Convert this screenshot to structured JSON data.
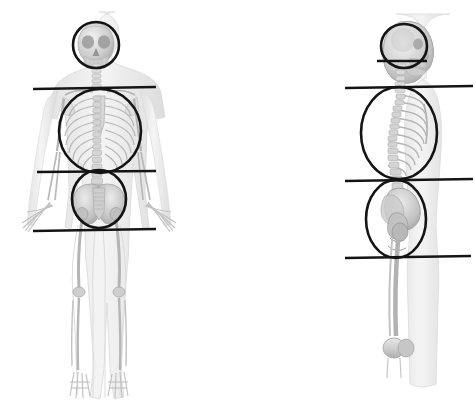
{
  "canvas": {
    "width": 475,
    "height": 414,
    "background": "#ffffff",
    "title": "Human skeleton anterior and lateral views with body-region overlays"
  },
  "style": {
    "overlay_stroke": "#141414",
    "overlay_stroke_width": 2.6,
    "skeleton_bone_light": "#e4e4e4",
    "skeleton_bone_mid": "#bdbdbd",
    "skeleton_bone_dark": "#8d8d8d",
    "skeleton_outline": "#d2d2d2",
    "body_silhouette": "#ededed"
  },
  "figures": [
    {
      "id": "anterior-figure",
      "name": "Anterior skeleton figure",
      "view": "anterior",
      "label": "Front view",
      "center_x": 99,
      "overlays": {
        "circles": [
          {
            "id": "head-circle-front",
            "name": "head-region-circle",
            "region": "head",
            "cx": 96,
            "cy": 45,
            "rx": 23,
            "ry": 23
          },
          {
            "id": "thorax-circle-front",
            "name": "thorax-region-circle",
            "region": "thorax",
            "cx": 100,
            "cy": 131,
            "rx": 41,
            "ry": 42
          },
          {
            "id": "pelvis-circle-front",
            "name": "pelvis-region-circle",
            "region": "pelvis",
            "cx": 99,
            "cy": 199,
            "rx": 27,
            "ry": 29
          }
        ],
        "lines": [
          {
            "id": "line-shoulder-front",
            "name": "shoulder-reference-line",
            "label": "Shoulder line",
            "x1": 33,
            "y1": 89,
            "x2": 156,
            "y2": 87
          },
          {
            "id": "line-waist-front",
            "name": "waist-reference-line",
            "label": "Waist line",
            "x1": 37,
            "y1": 172,
            "x2": 156,
            "y2": 171
          },
          {
            "id": "line-hip-front",
            "name": "hip-reference-line",
            "label": "Hip line",
            "x1": 33,
            "y1": 231,
            "x2": 156,
            "y2": 229
          }
        ]
      }
    },
    {
      "id": "lateral-figure",
      "name": "Lateral skeleton figure",
      "view": "lateral",
      "label": "Side view",
      "center_x": 398,
      "overlays": {
        "circles": [
          {
            "id": "head-circle-side",
            "name": "head-region-circle",
            "region": "head",
            "cx": 404,
            "cy": 46,
            "rx": 23,
            "ry": 22
          },
          {
            "id": "thorax-circle-side",
            "name": "thorax-region-circle",
            "region": "thorax",
            "cx": 399,
            "cy": 133,
            "rx": 38,
            "ry": 46
          },
          {
            "id": "pelvis-circle-side",
            "name": "pelvis-region-circle",
            "region": "pelvis",
            "cx": 396,
            "cy": 219,
            "rx": 30,
            "ry": 39
          }
        ],
        "lines": [
          {
            "id": "line-chin-side",
            "name": "chin-reference-line",
            "label": "Chin line",
            "x1": 377,
            "y1": 61,
            "x2": 427,
            "y2": 61
          },
          {
            "id": "line-shoulder-side",
            "name": "shoulder-reference-line",
            "label": "Shoulder line",
            "x1": 345,
            "y1": 88,
            "x2": 473,
            "y2": 86
          },
          {
            "id": "line-waist-side",
            "name": "waist-reference-line",
            "label": "Waist line",
            "x1": 345,
            "y1": 181,
            "x2": 473,
            "y2": 179
          },
          {
            "id": "line-hip-side",
            "name": "hip-reference-line",
            "label": "Hip line",
            "x1": 345,
            "y1": 258,
            "x2": 471,
            "y2": 256
          }
        ]
      }
    }
  ]
}
